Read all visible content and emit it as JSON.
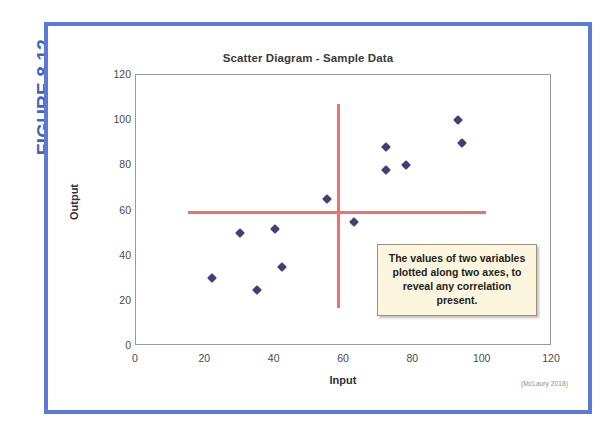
{
  "figure": {
    "label": "FIGURE 8.12",
    "label_color": "#3f62c8",
    "border_color": "#5b79d6",
    "attribution": "(McLaury 2018)"
  },
  "callout": {
    "text": "The values of two variables plotted along two axes, to reveal any correlation present.",
    "background": "#fbf6dd",
    "border_color": "#9c9478"
  },
  "chart_data": {
    "type": "scatter",
    "title": "Scatter Diagram - Sample Data",
    "xlabel": "Input",
    "ylabel": "Output",
    "xlim": [
      0,
      120
    ],
    "ylim": [
      0,
      120
    ],
    "xticks": [
      0,
      20,
      40,
      60,
      80,
      100,
      120
    ],
    "yticks": [
      0,
      20,
      40,
      60,
      80,
      100,
      120
    ],
    "grid": false,
    "legend": null,
    "marker_color": "#3f3f7a",
    "marker_shape": "diamond",
    "points": [
      {
        "x": 22,
        "y": 30
      },
      {
        "x": 30,
        "y": 50
      },
      {
        "x": 35,
        "y": 25
      },
      {
        "x": 40,
        "y": 52
      },
      {
        "x": 42,
        "y": 35
      },
      {
        "x": 55,
        "y": 65
      },
      {
        "x": 63,
        "y": 55
      },
      {
        "x": 72,
        "y": 88
      },
      {
        "x": 72,
        "y": 78
      },
      {
        "x": 78,
        "y": 80
      },
      {
        "x": 93,
        "y": 100
      },
      {
        "x": 94,
        "y": 90
      }
    ],
    "reference_lines": [
      {
        "name": "vertical-median",
        "orientation": "vertical",
        "x": 58,
        "y_start": 17,
        "y_end": 107,
        "color": "#f2706a"
      },
      {
        "name": "horizontal-median",
        "orientation": "horizontal",
        "y": 60,
        "x_start": 15,
        "x_end": 101,
        "color": "#f2706a"
      }
    ]
  }
}
